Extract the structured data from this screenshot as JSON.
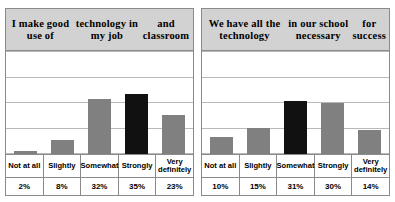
{
  "chart_data": [
    {
      "type": "bar",
      "title": "I make good use of technology in my job and classroom",
      "title_lines": [
        "I make good use of",
        "technology in my job",
        "and classroom"
      ],
      "categories": [
        "Not at all",
        "Slightly",
        "Somewhat",
        "Strongly",
        "Very definitely"
      ],
      "category_lines": [
        [
          "Not at all"
        ],
        [
          "Slightly"
        ],
        [
          "Somewhat"
        ],
        [
          "Strongly"
        ],
        [
          "Very",
          "definitely"
        ]
      ],
      "values": [
        2,
        8,
        32,
        35,
        23
      ],
      "value_labels": [
        "2%",
        "8%",
        "32%",
        "35%",
        "23%"
      ],
      "highlight_index": 3,
      "xlabel": "",
      "ylabel": "",
      "ylim": [
        0,
        60
      ],
      "gridlines": 5,
      "grid": true,
      "legend": "none",
      "colors": {
        "bar": "#808080",
        "highlight": "#111111",
        "grid": "#b9b9b9",
        "band": "#d2d2d2",
        "border": "#8a8a8a"
      }
    },
    {
      "type": "bar",
      "title": "We have all the technology in our school necessary for success",
      "title_lines": [
        "We have all the technology",
        "in our school necessary",
        "for success"
      ],
      "categories": [
        "Not at all",
        "Slightly",
        "Somewhat",
        "Strongly",
        "Very definitely"
      ],
      "category_lines": [
        [
          "Not at all"
        ],
        [
          "Slightly"
        ],
        [
          "Somewhat"
        ],
        [
          "Strongly"
        ],
        [
          "Very",
          "definitely"
        ]
      ],
      "values": [
        10,
        15,
        31,
        30,
        14
      ],
      "value_labels": [
        "10%",
        "15%",
        "31%",
        "30%",
        "14%"
      ],
      "highlight_index": 2,
      "xlabel": "",
      "ylabel": "",
      "ylim": [
        0,
        60
      ],
      "gridlines": 5,
      "grid": true,
      "legend": "none",
      "colors": {
        "bar": "#808080",
        "highlight": "#111111",
        "grid": "#b9b9b9",
        "band": "#d2d2d2",
        "border": "#8a8a8a"
      }
    }
  ]
}
